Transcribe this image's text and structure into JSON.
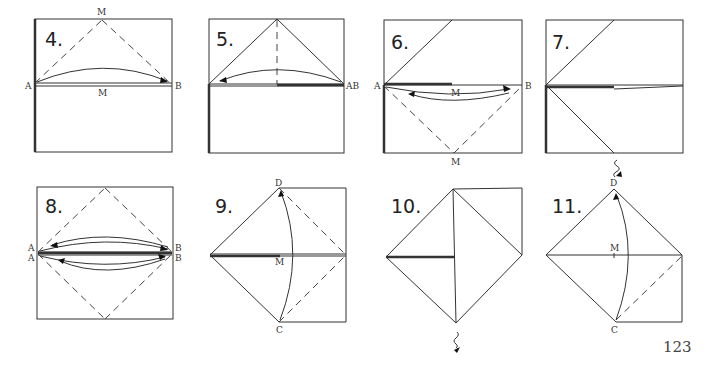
{
  "page_number": "123",
  "steps": [
    {
      "number": "4.",
      "labels": {
        "top": "M",
        "left": "A",
        "right": "B",
        "mid": "M"
      }
    },
    {
      "number": "5.",
      "labels": {
        "right": "AB"
      }
    },
    {
      "number": "6.",
      "labels": {
        "left": "A",
        "right": "B",
        "mid": "M",
        "bottom": "M"
      }
    },
    {
      "number": "7.",
      "labels": {}
    },
    {
      "number": "8.",
      "labels": {
        "left_top": "A",
        "left_bottom": "A",
        "right_top": "B",
        "right_bottom": "B"
      }
    },
    {
      "number": "9.",
      "labels": {
        "top": "D",
        "mid": "M",
        "bottom": "C"
      }
    },
    {
      "number": "10.",
      "labels": {}
    },
    {
      "number": "11.",
      "labels": {
        "top": "D",
        "mid": "M",
        "bottom": "C"
      }
    }
  ]
}
